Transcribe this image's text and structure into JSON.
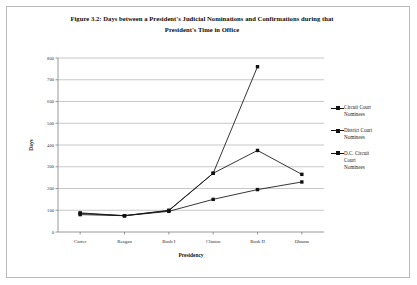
{
  "figure": {
    "title_line1": "Figure 3.2: Days between a President's Judicial Nominations and Confirmations during that",
    "title_line2": "President's Time in Office"
  },
  "chart_data": {
    "type": "line",
    "title": "Figure 3.2: Days between a President's Judicial Nominations and Confirmations during that President's Time in Office",
    "xlabel": "Presidency",
    "ylabel": "Days",
    "categories": [
      "Carter",
      "Reagan",
      "Bush I",
      "Clinton",
      "Bush II",
      "Obama"
    ],
    "ylim": [
      0,
      800
    ],
    "ytick_values": [
      0,
      100,
      200,
      300,
      400,
      500,
      600,
      700,
      800
    ],
    "ytick_labels": [
      "0",
      "100",
      "200",
      "300",
      "400",
      "500",
      "600",
      "700",
      "800"
    ],
    "grid": "horizontal",
    "legend_position": "right",
    "marker": "square",
    "series": [
      {
        "name": "Circuit Court Nominees",
        "values": [
          85,
          75,
          98,
          270,
          760,
          null
        ]
      },
      {
        "name": "District Court Nominees",
        "values": [
          80,
          75,
          95,
          150,
          195,
          230
        ]
      },
      {
        "name": "D.C. Circuit Court Nominees",
        "values": [
          88,
          75,
          100,
          270,
          375,
          265
        ]
      }
    ]
  },
  "legend": {
    "items": [
      {
        "label_line1": "Circuit Court",
        "label_line2": "Nominees"
      },
      {
        "label_line1": "District Court",
        "label_line2": "Nominees"
      },
      {
        "label_line1": "D.C. Circuit",
        "label_line2": "Court",
        "label_line3": "Nominees"
      }
    ]
  }
}
